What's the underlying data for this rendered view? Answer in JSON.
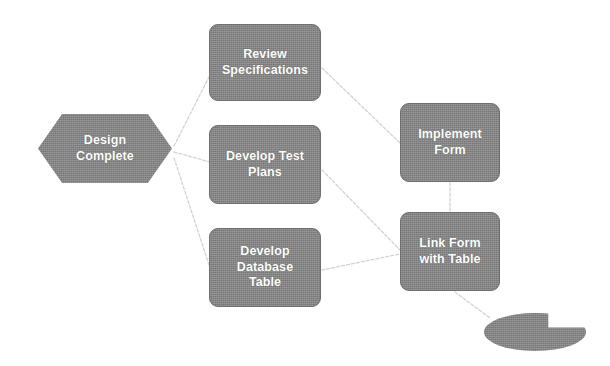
{
  "diagram": {
    "type": "flowchart",
    "background_color": "#ffffff",
    "node_fill_color": "#7f7f7f",
    "node_text_color": "#ffffff",
    "edge_color": "#d2d2d2",
    "edge_style": "dashed"
  },
  "nodes": [
    {
      "id": "design-complete",
      "label": "Design\nComplete",
      "shape": "hexagon",
      "x": 38,
      "y": 114,
      "width": 134,
      "height": 69
    },
    {
      "id": "review-specifications",
      "label": "Review\nSpecifications",
      "shape": "rounded-rectangle",
      "x": 209,
      "y": 24,
      "width": 112,
      "height": 77
    },
    {
      "id": "develop-test-plans",
      "label": "Develop Test\nPlans",
      "shape": "rounded-rectangle",
      "x": 209,
      "y": 125,
      "width": 112,
      "height": 79
    },
    {
      "id": "develop-database-table",
      "label": "Develop\nDatabase\nTable",
      "shape": "rounded-rectangle",
      "x": 209,
      "y": 228,
      "width": 112,
      "height": 79
    },
    {
      "id": "implement-form",
      "label": "Implement\nForm",
      "shape": "rounded-rectangle",
      "x": 400,
      "y": 103,
      "width": 100,
      "height": 79
    },
    {
      "id": "link-form-with-table",
      "label": "Link Form\nwith Table",
      "shape": "rounded-rectangle",
      "x": 400,
      "y": 212,
      "width": 100,
      "height": 79
    },
    {
      "id": "end-terminator",
      "label": "",
      "shape": "oval-notched",
      "x": 484,
      "y": 313,
      "width": 102,
      "height": 38
    }
  ],
  "edges": [
    {
      "id": "edge-design-to-review",
      "from": "design-complete",
      "to": "review-specifications",
      "points": "174,146 210,75"
    },
    {
      "id": "edge-design-to-test",
      "from": "design-complete",
      "to": "develop-test-plans",
      "points": "174,152 210,162"
    },
    {
      "id": "edge-design-to-database",
      "from": "design-complete",
      "to": "develop-database-table",
      "points": "174,158 210,268"
    },
    {
      "id": "edge-review-to-implement",
      "from": "review-specifications",
      "to": "implement-form",
      "points": "322,68 400,143"
    },
    {
      "id": "edge-test-to-link",
      "from": "develop-test-plans",
      "to": "link-form-with-table",
      "points": "322,170 400,250"
    },
    {
      "id": "edge-database-to-link",
      "from": "develop-database-table",
      "to": "link-form-with-table",
      "points": "322,270 400,254"
    },
    {
      "id": "edge-implement-to-link",
      "from": "implement-form",
      "to": "link-form-with-table",
      "points": "450,183 450,211"
    },
    {
      "id": "edge-link-to-end",
      "from": "link-form-with-table",
      "to": "end-terminator",
      "points": "455,292 490,318"
    }
  ]
}
